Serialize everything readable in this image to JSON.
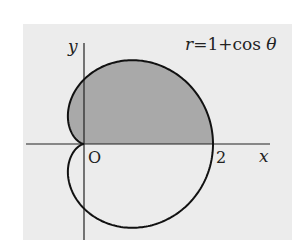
{
  "figure": {
    "equation_label": "r=1+cos θ",
    "axis_x_label": "x",
    "axis_y_label": "y",
    "origin_label": "O",
    "tick_label_2": "2",
    "background_color": "#ececec",
    "shade_color": "#a9a9a9",
    "curve_color": "#111111",
    "curve": {
      "type": "cardioid",
      "equation": "r = 1 + cos(theta)",
      "shaded_region": "upper half, 0 <= theta <= pi"
    }
  }
}
